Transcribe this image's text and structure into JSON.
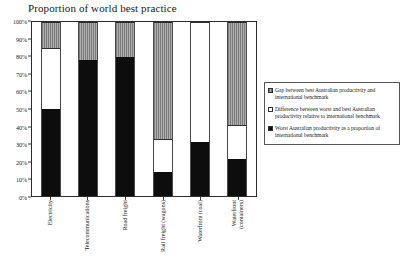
{
  "chart_data": {
    "type": "bar",
    "subtype": "stacked-bar",
    "title": "Proportion of world best practice",
    "xlabel": "",
    "ylabel": "",
    "ylim": [
      0,
      100
    ],
    "yunit": "%",
    "grid": false,
    "legend_position": "right",
    "ytick_labels": [
      "100%",
      "90%",
      "80%",
      "70%",
      "60%",
      "50%",
      "40%",
      "30%",
      "20%",
      "10%",
      "0%"
    ],
    "ytick_values": [
      100,
      90,
      80,
      70,
      60,
      50,
      40,
      30,
      20,
      10,
      0
    ],
    "categories": [
      "Electricity",
      "Telecommunications",
      "Road freight",
      "Rail freight (wagons)",
      "Waterfront (coal)",
      "Waterfront (containers)"
    ],
    "category_lines": [
      [
        "Electricity"
      ],
      [
        "Telecommunications"
      ],
      [
        "Road freight"
      ],
      [
        "Rail freight (wagons)"
      ],
      [
        "Waterfront (coal)"
      ],
      [
        "Waterfront",
        "(containers)"
      ]
    ],
    "series": [
      {
        "name": "Worst Australian productivity as a proportion of international benchmark",
        "key": "worst",
        "color": "#0d0d0d",
        "values": [
          50,
          78,
          80,
          14,
          31,
          21
        ]
      },
      {
        "name": "Difference between worst and best Australian productivity relative to international benchmark",
        "key": "diff",
        "color": "#ffffff",
        "values": [
          35,
          0,
          0,
          18.5,
          69,
          20
        ]
      },
      {
        "name": "Gap between best Australian productivity and international benchmark",
        "key": "gap",
        "color": "#9d9d9d",
        "values": [
          15,
          22,
          20,
          67.5,
          0,
          59
        ]
      }
    ],
    "cumulative_tops": {
      "worst": [
        50,
        78,
        80,
        14,
        31,
        21
      ],
      "diff": [
        85,
        78,
        80,
        32.5,
        100,
        41
      ],
      "gap": [
        100,
        100,
        100,
        100,
        100,
        100
      ]
    }
  },
  "legend": {
    "items": [
      {
        "swatch": "gap",
        "label": "Gap between best Australian productivity and international benchmark"
      },
      {
        "swatch": "diff",
        "label": "Difference between worst and best Australian productivity relative to international benchmark"
      },
      {
        "swatch": "worst",
        "label": "Worst Australian productivity as a proportion of international benchmark"
      }
    ]
  }
}
